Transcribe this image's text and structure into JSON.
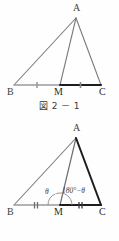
{
  "document": {
    "kind": "math-textbook-figure-pair",
    "background_color": "#fefefe"
  },
  "figures": [
    {
      "id": "figure-1",
      "caption": "図 2 － 1",
      "caption_prefix": "図",
      "caption_number": "2 － 1",
      "vertices": [
        {
          "name": "A",
          "label": "A",
          "x": 76,
          "y": 18
        },
        {
          "name": "B",
          "label": "B",
          "x": 14,
          "y": 85
        },
        {
          "name": "M",
          "label": "M",
          "x": 60,
          "y": 85
        },
        {
          "name": "C",
          "label": "C",
          "x": 101,
          "y": 85
        }
      ],
      "segments": [
        {
          "name": "AB",
          "from": "A",
          "to": "B",
          "style": "thin",
          "color": "#7b7b7b"
        },
        {
          "name": "AM",
          "from": "A",
          "to": "M",
          "style": "thin",
          "color": "#7b7b7b"
        },
        {
          "name": "AC",
          "from": "A",
          "to": "C",
          "style": "thin",
          "color": "#7b7b7b"
        },
        {
          "name": "BM",
          "from": "B",
          "to": "M",
          "style": "thin",
          "color": "#9b9b9b"
        },
        {
          "name": "MC",
          "from": "M",
          "to": "C",
          "style": "bold",
          "color": "#1d1d1d"
        }
      ],
      "tick_marks": [
        {
          "on": "BM",
          "count": 1
        },
        {
          "on": "MC",
          "count": 1
        }
      ],
      "angle_labels": []
    },
    {
      "id": "figure-2",
      "caption": "図 2 － 2",
      "caption_prefix": "図",
      "caption_number": "2 － 2",
      "vertices": [
        {
          "name": "A",
          "label": "A",
          "x": 76,
          "y": 18
        },
        {
          "name": "B",
          "label": "B",
          "x": 14,
          "y": 85
        },
        {
          "name": "M",
          "label": "M",
          "x": 60,
          "y": 85
        },
        {
          "name": "C",
          "label": "C",
          "x": 101,
          "y": 85
        }
      ],
      "segments": [
        {
          "name": "AB",
          "from": "A",
          "to": "B",
          "style": "thin",
          "color": "#7b7b7b"
        },
        {
          "name": "AM",
          "from": "A",
          "to": "M",
          "style": "thin",
          "color": "#6e6e6e"
        },
        {
          "name": "AC",
          "from": "A",
          "to": "C",
          "style": "bold",
          "color": "#1d1d1d"
        },
        {
          "name": "BM",
          "from": "B",
          "to": "M",
          "style": "thin",
          "color": "#9b9b9b"
        },
        {
          "name": "MC",
          "from": "M",
          "to": "C",
          "style": "bold",
          "color": "#1d1d1d"
        }
      ],
      "tick_marks": [
        {
          "on": "BM",
          "count": 2
        },
        {
          "on": "MC",
          "count": 2
        }
      ],
      "angle_labels": [
        {
          "name": "angle-AMB",
          "text": "θ",
          "x": 45,
          "y": 72
        },
        {
          "name": "angle-AMC",
          "text": "180°−θ",
          "x": 63,
          "y": 71
        }
      ]
    }
  ]
}
